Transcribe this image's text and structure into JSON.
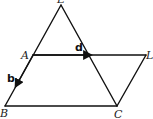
{
  "diagram": {
    "points": {
      "top": {
        "label": "E",
        "x": 61,
        "y": 5
      },
      "A": {
        "label": "A",
        "x": 33,
        "y": 55
      },
      "L": {
        "label": "L",
        "x": 146,
        "y": 55
      },
      "B": {
        "label": "B",
        "x": 5,
        "y": 106
      },
      "C": {
        "label": "C",
        "x": 117,
        "y": 106
      }
    },
    "vectors": {
      "d": {
        "label": "d",
        "from": "A",
        "direction": "toward L"
      },
      "b": {
        "label": "b",
        "from": "A",
        "direction": "toward B"
      }
    },
    "colors": {
      "stroke": "#111111",
      "label": "#222222"
    }
  }
}
